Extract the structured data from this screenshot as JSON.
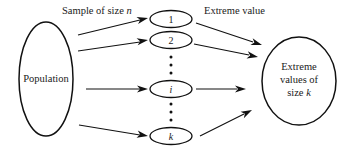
{
  "diagram": {
    "type": "flow-diagram",
    "background_color": "#ffffff",
    "stroke_color": "#111111",
    "labels": {
      "sample_label": "Sample of size",
      "sample_label_var": "n",
      "extreme_label": "Extreme value"
    },
    "source_node": {
      "name": "population",
      "text": "Population"
    },
    "sample_nodes": [
      {
        "name": "sample-1",
        "text": "1",
        "italic": false
      },
      {
        "name": "sample-2",
        "text": "2",
        "italic": false
      },
      {
        "name": "sample-i",
        "text": "i",
        "italic": true
      },
      {
        "name": "sample-k",
        "text": "k",
        "italic": true
      }
    ],
    "vertical_ellipsis": [
      {
        "name": "ellipsis-upper",
        "dots": 3
      },
      {
        "name": "ellipsis-lower",
        "dots": 3
      }
    ],
    "target_node": {
      "name": "extreme-values",
      "line1": "Extreme",
      "line2": "values of",
      "line3_prefix": "size",
      "line3_var": "k"
    },
    "arrows": {
      "sampling": 4,
      "extraction": 4
    }
  }
}
